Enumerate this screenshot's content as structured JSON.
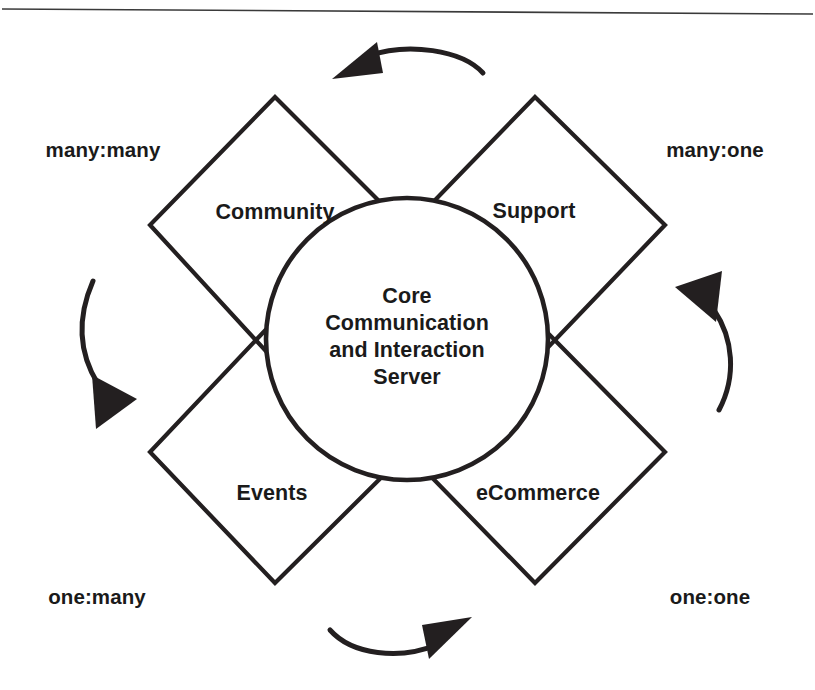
{
  "diagram": {
    "title_text_lines": [
      "Core",
      "Communication",
      "and Interaction",
      "Server"
    ],
    "center": {
      "line1": "Core",
      "line2": "Communication",
      "line3": "and Interaction",
      "line4": "Server"
    },
    "quadrants": [
      {
        "id": "community",
        "label": "Community",
        "position": "top-left"
      },
      {
        "id": "support",
        "label": "Support",
        "position": "top-right"
      },
      {
        "id": "events",
        "label": "Events",
        "position": "bottom-left"
      },
      {
        "id": "ecommerce",
        "label": "eCommerce",
        "position": "bottom-right"
      }
    ],
    "cardinality_labels": [
      {
        "id": "many-many",
        "label": "many:many",
        "position": "top-left"
      },
      {
        "id": "many-one",
        "label": "many:one",
        "position": "top-right"
      },
      {
        "id": "one-many",
        "label": "one:many",
        "position": "bottom-left"
      },
      {
        "id": "one-one",
        "label": "one:one",
        "position": "bottom-right"
      }
    ],
    "flow_arrows": [
      {
        "id": "top-arrow",
        "direction": "right-to-left",
        "position": "top"
      },
      {
        "id": "left-arrow",
        "direction": "top-to-bottom",
        "position": "left"
      },
      {
        "id": "bottom-arrow",
        "direction": "left-to-right",
        "position": "bottom"
      },
      {
        "id": "right-arrow",
        "direction": "bottom-to-top",
        "position": "right"
      }
    ],
    "colors": {
      "stroke": "#231f20",
      "text": "#1a1a1a",
      "background": "#ffffff",
      "rule": "#3a3a3a"
    }
  }
}
